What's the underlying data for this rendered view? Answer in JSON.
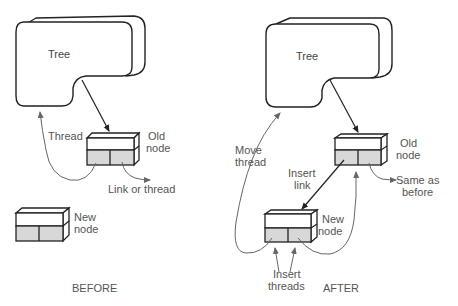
{
  "diagram": {
    "before": {
      "caption": "BEFORE",
      "tree_label": "Tree",
      "old_node_label": [
        "Old",
        "node"
      ],
      "new_node_label": [
        "New",
        "node"
      ],
      "thread_label": "Thread",
      "link_or_thread_label": "Link or thread"
    },
    "after": {
      "caption": "AFTER",
      "tree_label": "Tree",
      "old_node_label": [
        "Old",
        "node"
      ],
      "new_node_label": [
        "New",
        "node"
      ],
      "move_thread_label": [
        "Move",
        "thread"
      ],
      "insert_link_label": [
        "Insert",
        "link"
      ],
      "same_as_before_label": [
        "Same as",
        "before"
      ],
      "insert_threads_label": [
        "Insert",
        "threads"
      ]
    },
    "colors": {
      "outline": "#222222",
      "node_fill_shaded": "#d8d8d8",
      "label_text": "#555555"
    }
  }
}
